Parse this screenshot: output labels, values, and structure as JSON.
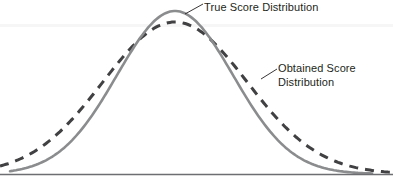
{
  "figure": {
    "title": "",
    "background_color": "#ffffff",
    "width": 393,
    "height": 188
  },
  "annotations": {
    "true_label": "True Score Distribution",
    "obtained_label_line1": "Obtained Score",
    "obtained_label_line2": "Distribution",
    "text_color": "#231f20"
  },
  "chart_data": {
    "type": "line",
    "title": "",
    "xlabel": "",
    "ylabel": "",
    "grid": false,
    "legend_position": "inline-annotations",
    "axis": {
      "baseline_y": 174,
      "x_start": 0,
      "x_end": 393,
      "color": "#6d6e71",
      "width": 1.4
    },
    "x": [
      0,
      20,
      40,
      60,
      80,
      100,
      120,
      140,
      160,
      175,
      190,
      210,
      230,
      250,
      270,
      290,
      310,
      330,
      350,
      370,
      393
    ],
    "series": [
      {
        "name": "True Score Distribution",
        "style": "solid",
        "color": "#8a8c8e",
        "stroke_width": 2.6,
        "mean": 175,
        "sigma": 58,
        "peak_y": 11,
        "values": [
          174,
          173,
          171,
          166,
          155,
          133,
          98,
          57,
          24,
          11,
          18,
          48,
          90,
          127,
          152,
          165,
          170,
          173,
          174,
          174,
          174
        ]
      },
      {
        "name": "Obtained Score Distribution",
        "style": "dashed",
        "color": "#414042",
        "stroke_width": 3.0,
        "dash_pattern": "9 7",
        "mean": 175,
        "sigma": 72,
        "peak_y": 22,
        "values": [
          160,
          155,
          148,
          137,
          121,
          101,
          76,
          50,
          30,
          22,
          27,
          45,
          72,
          101,
          125,
          144,
          155,
          162,
          166,
          168,
          169
        ]
      }
    ],
    "leader_lines": [
      {
        "for": "True Score Distribution",
        "from_x": 185,
        "from_y": 14,
        "to_x": 203,
        "to_y": 4
      },
      {
        "for": "Obtained Score Distribution",
        "from_x": 261,
        "from_y": 79,
        "to_x": 277,
        "to_y": 69
      }
    ]
  }
}
